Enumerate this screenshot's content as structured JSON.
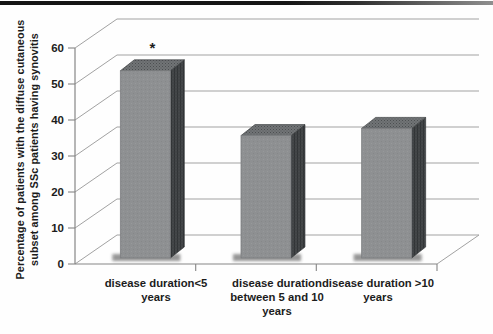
{
  "chart_data": {
    "type": "bar",
    "style": "3d-column",
    "title": "",
    "xlabel": "",
    "ylabel": "Percentage of patients with the diffuse cutaneous subset among SSc patients having synovitis",
    "ylabel_lines": [
      "Percentage of patients with the diffuse cutaneous",
      "subset among SSc patients having synovitis"
    ],
    "categories": [
      "disease duration<5 years",
      "disease duration between 5 and 10 years",
      "disease duration >10 years"
    ],
    "category_label_lines": [
      [
        "disease duration<5",
        "years"
      ],
      [
        "disease duration",
        "between 5 and 10",
        "years"
      ],
      [
        "disease duration >10",
        "years"
      ]
    ],
    "values": [
      52,
      34,
      36
    ],
    "yticks": [
      0,
      10,
      20,
      30,
      40,
      50,
      60
    ],
    "ylim": [
      0,
      60
    ],
    "grid": true,
    "legend": false,
    "annotations": [
      {
        "text": "*",
        "category_index": 0,
        "position": "above-bar"
      }
    ]
  },
  "colors": {
    "bar_front": "#8e9092",
    "bar_top": "#717476",
    "bar_side": "#45484a",
    "gridline": "#a2a2a2",
    "axis": "#858585",
    "text": "#1c1c1c",
    "top_rule": "#161616",
    "background": "#fefefe"
  }
}
